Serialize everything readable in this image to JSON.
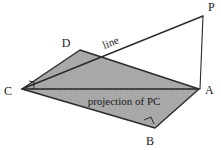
{
  "figure": {
    "type": "3d-geometry-diagram",
    "background_color": "#ffffff",
    "plane_fill_color": "#a8a8a8",
    "stroke_color": "#2b2b2b"
  },
  "vertices": {
    "P": {
      "label": "P",
      "x": 203,
      "y": 15,
      "label_x": 208,
      "label_y": 11
    },
    "A": {
      "label": "A",
      "x": 199,
      "y": 89,
      "label_x": 205,
      "label_y": 94
    },
    "B": {
      "label": "B",
      "x": 155,
      "y": 128,
      "label_x": 150,
      "label_y": 145
    },
    "C": {
      "label": "C",
      "x": 22,
      "y": 89,
      "label_x": 4,
      "label_y": 95
    },
    "D": {
      "label": "D",
      "x": 80,
      "y": 50,
      "label_x": 66,
      "label_y": 47
    }
  },
  "annotations": {
    "line_label": {
      "text": "line",
      "x": 112,
      "y": 46,
      "rotation": -22
    },
    "projection_label": {
      "text": "projection of PC",
      "x": 124,
      "y": 105
    }
  },
  "segments": {
    "plane_edges": [
      "C-D",
      "D-A",
      "A-B",
      "B-C"
    ],
    "vertical_PA": "P-A",
    "slant_PC": "P-C",
    "projection_dashed": "C-A"
  },
  "right_angles": [
    {
      "at": "C",
      "between": "projection-and-CD"
    },
    {
      "at": "B",
      "between": "AB-and-BC"
    }
  ]
}
